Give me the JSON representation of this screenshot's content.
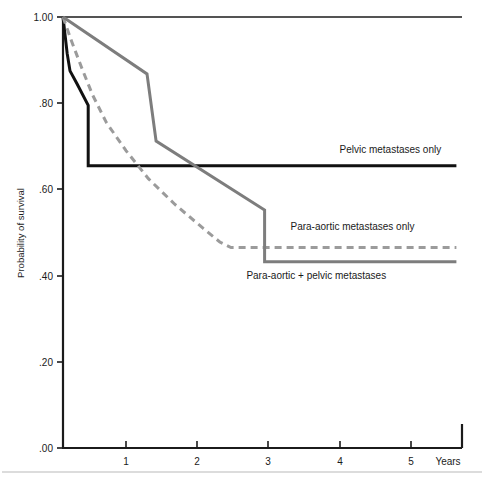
{
  "chart_data": {
    "type": "line",
    "title": "",
    "subtitle": "",
    "xlabel": "Years",
    "ylabel": "Probability of survival",
    "xlim": [
      0,
      5.7
    ],
    "ylim": [
      0.0,
      1.0
    ],
    "grid": false,
    "legend_position": "inline-right-of-curves",
    "x_ticks": [
      "1",
      "2",
      "3",
      "4",
      "5"
    ],
    "x_tick_values": [
      1,
      2,
      3,
      4,
      5
    ],
    "y_ticks": [
      "1.00",
      ".80",
      ".60",
      ".40",
      ".20",
      ".00"
    ],
    "y_tick_values": [
      1.0,
      0.8,
      0.6,
      0.4,
      0.2,
      0.0
    ],
    "series": [
      {
        "name": "Pelvic metastases only",
        "color": "#111111",
        "style": "solid",
        "width": 3.0,
        "label": "Pelvic metastases only",
        "label_x": 3.95,
        "label_y": 0.685,
        "final_value": 0.655,
        "points": [
          {
            "x": 0.0,
            "y": 1.0
          },
          {
            "x": 0.06,
            "y": 0.915
          },
          {
            "x": 0.1,
            "y": 0.875
          },
          {
            "x": 0.2,
            "y": 0.845
          },
          {
            "x": 0.36,
            "y": 0.795
          },
          {
            "x": 0.36,
            "y": 0.655
          },
          {
            "x": 5.62,
            "y": 0.655
          }
        ]
      },
      {
        "name": "Para-aortic metastases only",
        "color": "#9b9b9b",
        "style": "dashed",
        "width": 3.0,
        "label": "Para-aortic metastases only",
        "label_x": 3.25,
        "label_y": 0.505,
        "final_value": 0.465,
        "dash": "7,5",
        "points": [
          {
            "x": 0.0,
            "y": 1.0
          },
          {
            "x": 0.12,
            "y": 0.945
          },
          {
            "x": 0.26,
            "y": 0.885
          },
          {
            "x": 0.42,
            "y": 0.82
          },
          {
            "x": 0.62,
            "y": 0.755
          },
          {
            "x": 0.9,
            "y": 0.69
          },
          {
            "x": 1.22,
            "y": 0.625
          },
          {
            "x": 1.6,
            "y": 0.565
          },
          {
            "x": 2.0,
            "y": 0.51
          },
          {
            "x": 2.24,
            "y": 0.478
          },
          {
            "x": 2.4,
            "y": 0.465
          },
          {
            "x": 5.62,
            "y": 0.465
          }
        ]
      },
      {
        "name": "Para-aortic + pelvic metastases",
        "color": "#7d7d7d",
        "style": "solid",
        "width": 3.0,
        "label": "Para-aortic + pelvic metastases",
        "label_x": 2.62,
        "label_y": 0.393,
        "final_value": 0.432,
        "points": [
          {
            "x": 0.0,
            "y": 1.0
          },
          {
            "x": 1.2,
            "y": 0.868
          },
          {
            "x": 1.33,
            "y": 0.712
          },
          {
            "x": 2.88,
            "y": 0.552
          },
          {
            "x": 2.88,
            "y": 0.432
          },
          {
            "x": 5.62,
            "y": 0.432
          }
        ]
      }
    ]
  }
}
